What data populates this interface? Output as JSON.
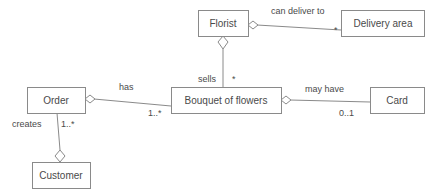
{
  "diagram": {
    "kind": "uml-class-diagram",
    "width": 436,
    "height": 193,
    "background_color": "#ffffff",
    "line_color": "#8a8a8a",
    "text_color": "#4a4a4a",
    "box_fill_color": "#ffffff"
  },
  "classes": {
    "florist": {
      "name": "Florist",
      "x": 198,
      "y": 10,
      "w": 50,
      "h": 26,
      "cx": 223,
      "cy": 23
    },
    "delivery_area": {
      "name": "Delivery area",
      "x": 341,
      "y": 10,
      "w": 83,
      "h": 26,
      "cx": 382.5,
      "cy": 23
    },
    "bouquet": {
      "name": "Bouquet of flowers",
      "x": 171,
      "y": 87,
      "w": 110,
      "h": 26,
      "cx": 226,
      "cy": 100
    },
    "order": {
      "name": "Order",
      "x": 27,
      "y": 87,
      "w": 58,
      "h": 26,
      "cx": 56,
      "cy": 100
    },
    "card": {
      "name": "Card",
      "x": 370,
      "y": 87,
      "w": 54,
      "h": 26,
      "cx": 397,
      "cy": 100
    },
    "customer": {
      "name": "Customer",
      "x": 32,
      "y": 162,
      "w": 58,
      "h": 26,
      "cx": 61,
      "cy": 175
    }
  },
  "associations": {
    "florist_delivery_area": {
      "label": "can deliver to",
      "label_x": 271,
      "label_y": 14,
      "multiplicity": "*",
      "multiplicity_x": 334,
      "multiplicity_y": 32,
      "aggregation_end": "florist"
    },
    "florist_bouquet": {
      "label": "sells",
      "label_x": 198,
      "label_y": 79,
      "multiplicity": "*",
      "multiplicity_x": 233,
      "multiplicity_y": 79,
      "aggregation_end": "florist"
    },
    "order_bouquet": {
      "label": "has",
      "label_x": 119,
      "label_y": 88,
      "multiplicity": "1..*",
      "multiplicity_x": 150,
      "multiplicity_y": 113,
      "aggregation_end": "order"
    },
    "bouquet_card": {
      "label": "may have",
      "label_x": 305,
      "label_y": 91,
      "multiplicity": "0..1",
      "multiplicity_x": 340,
      "multiplicity_y": 113,
      "aggregation_end": "bouquet"
    },
    "order_customer": {
      "label": "creates",
      "label_x": 13,
      "label_y": 126,
      "multiplicity": "1..*",
      "multiplicity_x": 61,
      "multiplicity_y": 126,
      "aggregation_end": "customer"
    }
  }
}
